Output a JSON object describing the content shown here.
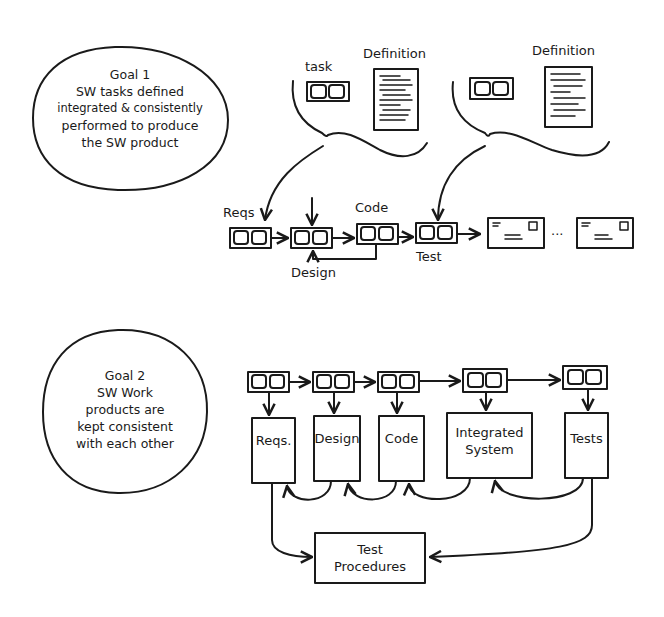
{
  "goal1": {
    "title": "Goal 1",
    "lines": [
      "SW tasks defined",
      "integrated & consistently",
      "performed to produce",
      "the SW product"
    ]
  },
  "goal2": {
    "title": "Goal 2",
    "lines": [
      "SW Work",
      "products are",
      "kept consistent",
      "with each other"
    ]
  },
  "top_diagram": {
    "task_label": "task",
    "definition_label_1": "Definition",
    "definition_label_2": "Definition",
    "process_labels": {
      "reqs": "Reqs",
      "design": "Design",
      "code": "Code",
      "test": "Test"
    },
    "ellipsis": "···"
  },
  "bottom_diagram": {
    "work_products": [
      "Reqs.",
      "Design",
      "Code",
      "Integrated",
      "System",
      "Tests"
    ],
    "integrated_system_line1": "Integrated",
    "integrated_system_line2": "System",
    "reqs": "Reqs.",
    "design": "Design",
    "code": "Code",
    "tests": "Tests",
    "test_procedures_line1": "Test",
    "test_procedures_line2": "Procedures"
  }
}
